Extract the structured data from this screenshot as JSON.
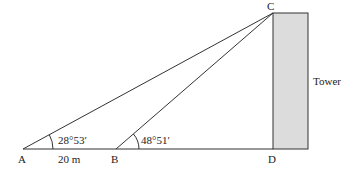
{
  "diagram": {
    "type": "angle-of-elevation",
    "points": {
      "A": {
        "label": "A",
        "x": 23,
        "y": 149
      },
      "B": {
        "label": "B",
        "x": 116,
        "y": 149
      },
      "C": {
        "label": "C",
        "x": 273,
        "y": 13
      },
      "D": {
        "label": "D",
        "x": 273,
        "y": 149
      }
    },
    "angles": {
      "at_A": "28°53′",
      "at_B": "48°51′"
    },
    "distance_AB": "20 m",
    "tower": {
      "label": "Tower",
      "fill": "#dcdcdc",
      "x": 273,
      "y": 13,
      "width": 35,
      "height": 136
    },
    "line_color": "#333333"
  }
}
